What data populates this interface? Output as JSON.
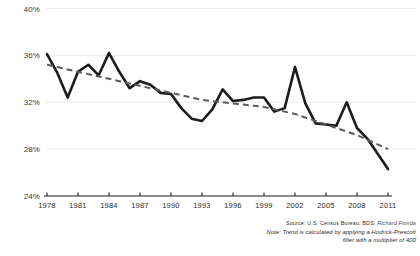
{
  "chart_data": {
    "type": "line",
    "title": "",
    "subtitle": "",
    "xlabel": "",
    "ylabel": "",
    "ylim": [
      24,
      40
    ],
    "xlim": [
      1978,
      2011
    ],
    "grid": true,
    "legend_position": "none",
    "y_ticks": [
      "40%",
      "36%",
      "32%",
      "28%",
      "24%"
    ],
    "y_tick_values": [
      40,
      36,
      32,
      28,
      24
    ],
    "x_ticks": [
      "1978",
      "1981",
      "1984",
      "1987",
      "1990",
      "1993",
      "1996",
      "1999",
      "2002",
      "2005",
      "2008",
      "2011"
    ],
    "x_tick_values": [
      1978,
      1981,
      1984,
      1987,
      1990,
      1993,
      1996,
      1999,
      2002,
      2005,
      2008,
      2011
    ],
    "x": [
      1978,
      1979,
      1980,
      1981,
      1982,
      1983,
      1984,
      1985,
      1986,
      1987,
      1988,
      1989,
      1990,
      1991,
      1992,
      1993,
      1994,
      1995,
      1996,
      1997,
      1998,
      1999,
      2000,
      2001,
      2002,
      2003,
      2004,
      2005,
      2006,
      2007,
      2008,
      2009,
      2010,
      2011
    ],
    "series": [
      {
        "name": "Share",
        "style": "solid",
        "color": "#1c1c1c",
        "values": [
          36.1,
          34.5,
          32.4,
          34.6,
          35.2,
          34.3,
          36.2,
          34.6,
          33.2,
          33.8,
          33.5,
          32.8,
          32.7,
          31.5,
          30.6,
          30.4,
          31.4,
          33.1,
          32.1,
          32.2,
          32.4,
          32.4,
          31.2,
          31.5,
          35.0,
          31.9,
          30.2,
          30.1,
          30.0,
          32.0,
          29.8,
          28.9,
          27.6,
          26.3
        ]
      },
      {
        "name": "Trend (Hodrick-Prescott)",
        "style": "dashed",
        "color": "#5c5c5c",
        "values": [
          35.2,
          35.0,
          34.8,
          34.6,
          34.4,
          34.2,
          34.0,
          33.8,
          33.6,
          33.4,
          33.2,
          33.0,
          32.8,
          32.6,
          32.4,
          32.2,
          32.1,
          32.0,
          31.9,
          31.8,
          31.7,
          31.6,
          31.4,
          31.2,
          31.0,
          30.7,
          30.4,
          30.1,
          29.8,
          29.5,
          29.2,
          28.8,
          28.4,
          28.0
        ]
      }
    ]
  },
  "footnote": {
    "source_label": "Source:",
    "source_text": "U.S. Census Bureau; BDS;",
    "source_credit": "Richard Florida",
    "note_line1": "Note: Trend is calculated by applying a Hodrick-Prescott",
    "note_line2": "filter with a multiplier of 400"
  },
  "colors": {
    "series": "#1c1c1c",
    "trend": "#5c5c5c",
    "grid": "#e2e2e2",
    "axis": "#1a1a1a",
    "background": "#ffffff"
  }
}
